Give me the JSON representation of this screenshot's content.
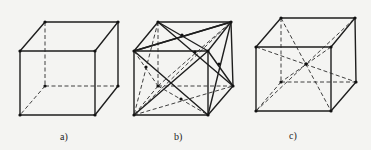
{
  "figure": {
    "panels": [
      {
        "id": "a",
        "label": "a)",
        "caption": "simple cubic unit cell"
      },
      {
        "id": "b",
        "label": "b)",
        "caption": "face-centered cubic unit cell"
      },
      {
        "id": "c",
        "label": "c)",
        "caption": "body-centered cubic unit cell"
      }
    ]
  }
}
